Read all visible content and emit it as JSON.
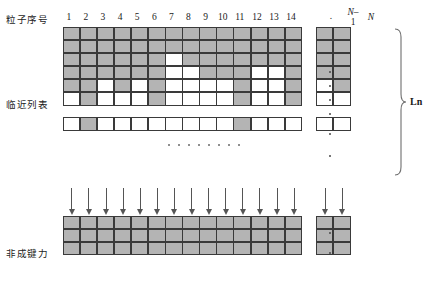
{
  "figure": {
    "row_labels": {
      "particle_index": "粒子序号",
      "neighbor_list": "临近列表",
      "nonbonded_force": "非成键力"
    },
    "column_headers": [
      "1",
      "2",
      "3",
      "4",
      "5",
      "6",
      "7",
      "8",
      "9",
      "10",
      "11",
      "12",
      "13",
      "14"
    ],
    "column_header_ellipsis": ".",
    "column_header_n_minus_1_top": "N–",
    "column_header_n_minus_1_bottom": "1",
    "column_header_n": "N",
    "brace_label": "Ln",
    "colors": {
      "cell_filled": "#b4b4b4",
      "cell_empty": "#ffffff",
      "cell_border": "#3a3a3a",
      "arrow": "#555555",
      "text": "#1a1a1a"
    },
    "neighbor_grid": {
      "columns_main": 14,
      "columns_tail": 2,
      "rows_top_block": 6,
      "rows_bottom_block": 1,
      "filled_main": [
        [
          1,
          1,
          1,
          1,
          1,
          1,
          1,
          1,
          1,
          1,
          1,
          1,
          1,
          1
        ],
        [
          1,
          1,
          1,
          1,
          1,
          1,
          1,
          1,
          1,
          1,
          1,
          1,
          1,
          1
        ],
        [
          1,
          1,
          1,
          1,
          1,
          1,
          0,
          1,
          1,
          1,
          1,
          1,
          1,
          1
        ],
        [
          1,
          1,
          1,
          1,
          1,
          1,
          0,
          0,
          1,
          1,
          1,
          0,
          0,
          1
        ],
        [
          1,
          1,
          0,
          1,
          0,
          1,
          0,
          0,
          0,
          0,
          1,
          0,
          0,
          1
        ],
        [
          0,
          1,
          0,
          0,
          0,
          1,
          0,
          0,
          0,
          0,
          1,
          0,
          0,
          1
        ],
        [
          0,
          1,
          0,
          0,
          0,
          0,
          0,
          0,
          0,
          0,
          1,
          0,
          0,
          0
        ]
      ],
      "filled_tail": [
        [
          1,
          1
        ],
        [
          1,
          1
        ],
        [
          1,
          1
        ],
        [
          1,
          1
        ],
        [
          0,
          1
        ],
        [
          0,
          0
        ],
        [
          0,
          0
        ]
      ]
    },
    "force_grid": {
      "columns_main": 14,
      "columns_tail": 2,
      "rows": 3,
      "filled_main": [
        [
          1,
          1,
          1,
          1,
          1,
          1,
          1,
          1,
          1,
          1,
          1,
          1,
          1,
          1
        ],
        [
          1,
          1,
          1,
          1,
          1,
          1,
          1,
          1,
          1,
          1,
          1,
          1,
          1,
          1
        ],
        [
          1,
          1,
          1,
          1,
          1,
          1,
          1,
          1,
          1,
          1,
          1,
          1,
          1,
          1
        ]
      ],
      "filled_tail": [
        [
          1,
          1
        ],
        [
          1,
          1
        ],
        [
          1,
          1
        ]
      ]
    },
    "arrow_count": 16
  }
}
